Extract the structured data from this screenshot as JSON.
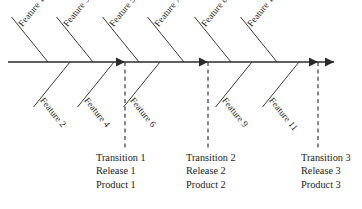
{
  "diagram": {
    "type": "fishbone-ishikawa",
    "title": "",
    "spine": {
      "y": 62,
      "x_start": 8,
      "x_end": 334,
      "color": "#2b2b2b",
      "arrow_positions_x": [
        125,
        208,
        318,
        334
      ]
    },
    "features": [
      {
        "id": "feature-1",
        "label": "Feature 1",
        "side": "top",
        "spine_x": 48,
        "segment": 1
      },
      {
        "id": "feature-2",
        "label": "Feature 2",
        "side": "bottom",
        "spine_x": 70,
        "segment": 1
      },
      {
        "id": "feature-3",
        "label": "Feature 3",
        "side": "top",
        "spine_x": 93,
        "segment": 1
      },
      {
        "id": "feature-4",
        "label": "Feature 4",
        "side": "bottom",
        "spine_x": 114,
        "segment": 1
      },
      {
        "id": "feature-5",
        "label": "Feature 5",
        "side": "top",
        "spine_x": 139,
        "segment": 2
      },
      {
        "id": "feature-6",
        "label": "Feature 6",
        "side": "bottom",
        "spine_x": 160,
        "segment": 2
      },
      {
        "id": "feature-7",
        "label": "Feature 7",
        "side": "top",
        "spine_x": 184,
        "segment": 2
      },
      {
        "id": "feature-8",
        "label": "Feature 8",
        "side": "top",
        "spine_x": 231,
        "segment": 3
      },
      {
        "id": "feature-9",
        "label": "Feature 9",
        "side": "bottom",
        "spine_x": 252,
        "segment": 3
      },
      {
        "id": "feature-10",
        "label": "Feature 10",
        "side": "top",
        "spine_x": 277,
        "segment": 3
      },
      {
        "id": "feature-11",
        "label": "Feature 11",
        "side": "bottom",
        "spine_x": 299,
        "segment": 3
      }
    ],
    "milestones": [
      {
        "id": "milestone-1",
        "dash_x": 125,
        "dash_y_top": 62,
        "dash_y_bottom": 150,
        "text_x": 96,
        "text_y": 151,
        "lines": [
          "Transition 1",
          "Release 1",
          "Product 1"
        ]
      },
      {
        "id": "milestone-2",
        "dash_x": 208,
        "dash_y_top": 62,
        "dash_y_bottom": 150,
        "text_x": 186,
        "text_y": 151,
        "lines": [
          "Transition 2",
          "Release 2",
          "Product 2"
        ]
      },
      {
        "id": "milestone-3",
        "dash_x": 318,
        "dash_y_top": 62,
        "dash_y_bottom": 150,
        "text_x": 301,
        "text_y": 151,
        "lines": [
          "Transition 3",
          "Release 3",
          "Product 3"
        ]
      }
    ],
    "style": {
      "line_color": "#3a3a3a",
      "spine_color": "#2b2b2b",
      "text_color": "#1d1d1d",
      "background": "#ffffff"
    }
  }
}
